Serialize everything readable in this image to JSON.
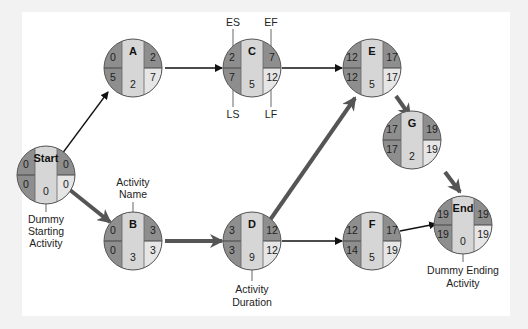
{
  "diagram": {
    "type": "activity-on-node network (critical path)",
    "colors": {
      "background": "#f2f2f2",
      "panel": "#ffffff",
      "dark_quadrant": "#8e8e8e",
      "center_strip": "#d6d6d6",
      "light_quadrant": "#e6e6e6",
      "critical_arrow": "#555555",
      "normal_arrow": "#111111"
    },
    "legend": {
      "es": "ES",
      "ef": "EF",
      "ls": "LS",
      "lf": "LF",
      "activity_name": "Activity Name",
      "activity_duration": "Activity Duration",
      "dummy_start": "Dummy Starting Activity",
      "dummy_end": "Dummy Ending Activity"
    },
    "nodes": [
      {
        "id": "start",
        "name": "Start",
        "es": "0",
        "ef": "0",
        "ls": "0",
        "lf": "0",
        "duration": "0"
      },
      {
        "id": "A",
        "name": "A",
        "es": "0",
        "ef": "2",
        "ls": "5",
        "lf": "7",
        "duration": "2"
      },
      {
        "id": "B",
        "name": "B",
        "es": "0",
        "ef": "3",
        "ls": "0",
        "lf": "3",
        "duration": "3"
      },
      {
        "id": "C",
        "name": "C",
        "es": "2",
        "ef": "7",
        "ls": "7",
        "lf": "12",
        "duration": "5"
      },
      {
        "id": "D",
        "name": "D",
        "es": "3",
        "ef": "12",
        "ls": "3",
        "lf": "12",
        "duration": "9"
      },
      {
        "id": "E",
        "name": "E",
        "es": "12",
        "ef": "17",
        "ls": "12",
        "lf": "17",
        "duration": "5"
      },
      {
        "id": "F",
        "name": "F",
        "es": "12",
        "ef": "17",
        "ls": "14",
        "lf": "19",
        "duration": "5"
      },
      {
        "id": "G",
        "name": "G",
        "es": "17",
        "ef": "19",
        "ls": "17",
        "lf": "19",
        "duration": "2"
      },
      {
        "id": "end",
        "name": "End",
        "es": "19",
        "ef": "19",
        "ls": "19",
        "lf": "19",
        "duration": "0"
      }
    ],
    "edges": [
      {
        "from": "Start",
        "to": "A",
        "critical": false
      },
      {
        "from": "Start",
        "to": "B",
        "critical": true
      },
      {
        "from": "A",
        "to": "C",
        "critical": false
      },
      {
        "from": "B",
        "to": "D",
        "critical": true
      },
      {
        "from": "C",
        "to": "E",
        "critical": false
      },
      {
        "from": "D",
        "to": "E",
        "critical": true
      },
      {
        "from": "D",
        "to": "F",
        "critical": false
      },
      {
        "from": "E",
        "to": "G",
        "critical": true
      },
      {
        "from": "G",
        "to": "End",
        "critical": true
      },
      {
        "from": "F",
        "to": "End",
        "critical": false
      }
    ]
  }
}
